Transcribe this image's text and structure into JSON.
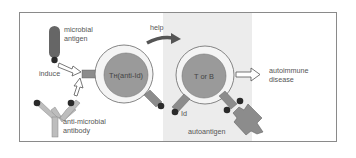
{
  "diagram": {
    "labels": {
      "microbial_antigen_line1": "microbial",
      "microbial_antigen_line2": "antigen",
      "induce": "induce",
      "anti_microbial_line1": "anti-microbial",
      "anti_microbial_line2": "antibody",
      "help": "help",
      "th_cell": "Tʜ(anti-Id)",
      "t_or_b_cell": "T or B",
      "id": "Id",
      "autoantigen": "autoantigen",
      "autoimmune_line1": "autoimmune",
      "autoimmune_line2": "disease"
    },
    "colors": {
      "frame_border": "#8a8a8a",
      "shaded_region": "#ececec",
      "cell_outer": "#f4f4f4",
      "cell_inner": "#9a9a9a",
      "receptor": "#8c8c8c",
      "receptor_tip": "#2a2a2a",
      "antigen": "#666666",
      "antibody": "#bdbdbd",
      "help_arrow": "#555555"
    }
  }
}
